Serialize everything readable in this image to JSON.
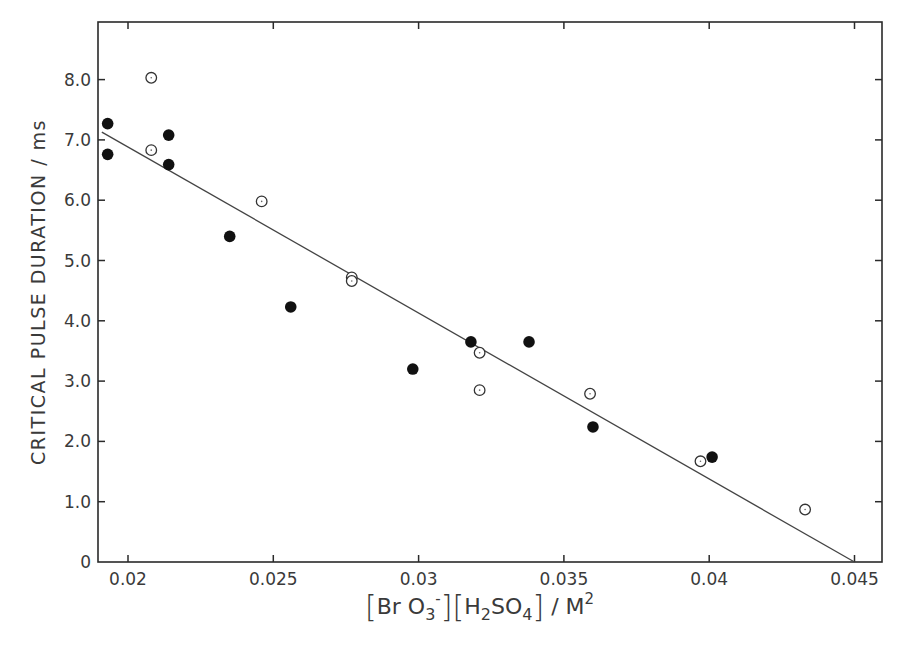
{
  "chart_data": {
    "type": "scatter",
    "title": "",
    "xlabel": "[BrO3-][H2SO4] / M2",
    "ylabel": "CRITICAL PULSE DURATION / ms",
    "xlim": [
      0.0191,
      0.0459
    ],
    "ylim": [
      0,
      8.95
    ],
    "x_ticks": [
      0.02,
      0.025,
      0.03,
      0.035,
      0.04,
      0.045
    ],
    "x_tick_labels": [
      "0.02",
      "0.025",
      "0.03",
      "0.035",
      "0.04",
      "0.045"
    ],
    "y_ticks": [
      0,
      1,
      2,
      3,
      4,
      5,
      6,
      7,
      8
    ],
    "y_tick_labels": [
      "0",
      "1.0",
      "2.0",
      "3.0",
      "4.0",
      "5.0",
      "6.0",
      "7.0",
      "8.0"
    ],
    "grid": false,
    "legend": "none",
    "series": [
      {
        "name": "filled circles",
        "marker": "filled-circle",
        "points": [
          {
            "x": 0.0193,
            "y": 7.27
          },
          {
            "x": 0.0193,
            "y": 6.76
          },
          {
            "x": 0.0214,
            "y": 7.08
          },
          {
            "x": 0.0214,
            "y": 6.59
          },
          {
            "x": 0.0235,
            "y": 5.4
          },
          {
            "x": 0.0256,
            "y": 4.23
          },
          {
            "x": 0.0298,
            "y": 3.2
          },
          {
            "x": 0.0318,
            "y": 3.65
          },
          {
            "x": 0.0338,
            "y": 3.65
          },
          {
            "x": 0.036,
            "y": 2.24
          },
          {
            "x": 0.0401,
            "y": 1.74
          }
        ]
      },
      {
        "name": "open circles",
        "marker": "open-circle",
        "points": [
          {
            "x": 0.0208,
            "y": 8.03
          },
          {
            "x": 0.0208,
            "y": 6.83
          },
          {
            "x": 0.0246,
            "y": 5.98
          },
          {
            "x": 0.0277,
            "y": 4.72
          },
          {
            "x": 0.0277,
            "y": 4.66
          },
          {
            "x": 0.0321,
            "y": 3.47
          },
          {
            "x": 0.0321,
            "y": 2.85
          },
          {
            "x": 0.0359,
            "y": 2.79
          },
          {
            "x": 0.0397,
            "y": 1.67
          },
          {
            "x": 0.0433,
            "y": 0.87
          }
        ]
      }
    ],
    "fit_line": {
      "type": "linear",
      "from": {
        "x": 0.0191,
        "y": 7.13
      },
      "to": {
        "x": 0.045,
        "y": 0.0
      }
    }
  },
  "labels": {
    "ylabel": "CRITICAL  PULSE  DURATION / ms",
    "xlabel_parts": {
      "open1": "[",
      "bro": "Br O",
      "bro_sub": "3",
      "bro_sup": "-",
      "close1": "]",
      "open2": "[",
      "h": "H",
      "h_sub": "2",
      "so": "SO",
      "so_sub": "4",
      "close2": "]",
      "unit": " / M",
      "unit_sup": "2"
    }
  },
  "colors": {
    "axis": "#2a2a2a",
    "marker": "#111111",
    "line": "#444444",
    "background": "#ffffff"
  }
}
